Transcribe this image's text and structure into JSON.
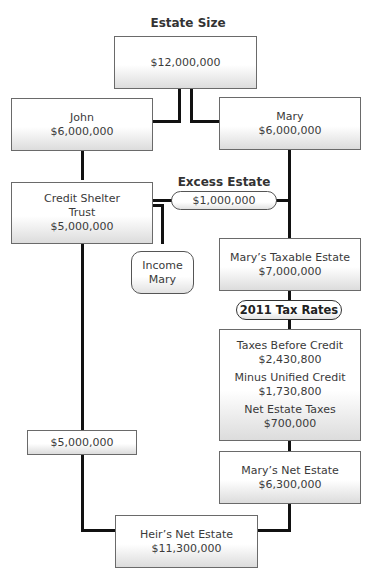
{
  "diagram": {
    "heading": "Estate Size",
    "estate_size": "$12,000,000",
    "john": {
      "name": "John",
      "amount": "$6,000,000"
    },
    "mary": {
      "name": "Mary",
      "amount": "$6,000,000"
    },
    "credit_shelter": {
      "line1": "Credit Shelter",
      "line2": "Trust",
      "amount": "$5,000,000"
    },
    "excess_estate": {
      "label": "Excess Estate",
      "amount": "$1,000,000"
    },
    "income": {
      "line1": "Income",
      "line2": "Mary"
    },
    "mary_taxable": {
      "label": "Mary’s Taxable Estate",
      "amount": "$7,000,000"
    },
    "tax_rates": "2011 Tax Rates",
    "taxes": {
      "before_label": "Taxes Before Credit",
      "before_amount": "$2,430,800",
      "credit_label": "Minus Unified Credit",
      "credit_amount": "$1,730,800",
      "net_label": "Net Estate Taxes",
      "net_amount": "$700,000"
    },
    "trust_amount": "$5,000,000",
    "mary_net": {
      "label": "Mary’s Net Estate",
      "amount": "$6,300,000"
    },
    "heir_net": {
      "label": "Heir’s Net Estate",
      "amount": "$11,300,000"
    }
  }
}
